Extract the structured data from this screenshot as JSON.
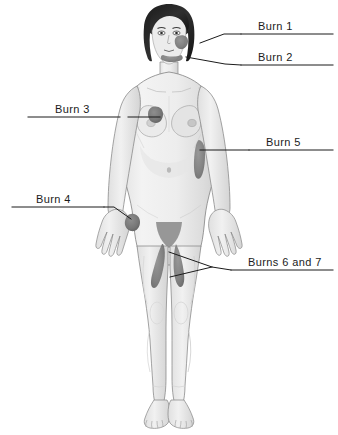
{
  "diagram": {
    "view": "anterior",
    "colors": {
      "skin": "#efefef",
      "skin_shadow": "#d6d6d6",
      "outline": "#6e6e6e",
      "hair": "#2a2a2a",
      "burn": "#7d7d7d",
      "burn_dark": "#5e5e5e",
      "leader_line": "#1b1b1b",
      "text": "#1b1b1b",
      "background": "#ffffff"
    },
    "labels": [
      {
        "id": "burn-1",
        "text": "Burn 1",
        "side": "right",
        "text_x": 258,
        "text_y": 20,
        "rule_x1": 241,
        "rule_x2": 333,
        "rule_y": 34,
        "leader": "M200,43 L224,34 L241,34",
        "site": "right cheek"
      },
      {
        "id": "burn-2",
        "text": "Burn 2",
        "side": "right",
        "text_x": 258,
        "text_y": 51,
        "rule_x1": 241,
        "rule_x2": 333,
        "rule_y": 65,
        "leader": "M186,57 L225,64 L241,65",
        "site": "jaw and chin"
      },
      {
        "id": "burn-3",
        "text": "Burn 3",
        "side": "left",
        "text_x": 55,
        "text_y": 103,
        "rule_x1": 28,
        "rule_x2": 120,
        "rule_y": 117,
        "leader": "M128,117 L160,117",
        "site": "upper left chest"
      },
      {
        "id": "burn-4",
        "text": "Burn 4",
        "side": "left",
        "text_x": 36,
        "text_y": 193,
        "rule_x1": 12,
        "rule_x2": 104,
        "rule_y": 207,
        "leader": "M104,207 L114,207 L131,219",
        "site": "back of left hand"
      },
      {
        "id": "burn-5",
        "text": "Burn 5",
        "side": "right",
        "text_x": 266,
        "text_y": 136,
        "rule_x1": 249,
        "rule_x2": 333,
        "rule_y": 150,
        "leader": "M200,150 L249,150",
        "site": "right flank of torso"
      },
      {
        "id": "burns-6-and-7",
        "text": "Burns 6 and 7",
        "side": "right",
        "text_x": 248,
        "text_y": 256,
        "rule_x1": 231,
        "rule_x2": 333,
        "rule_y": 270,
        "leader": "M169,252 L212,267 L231,270 M170,277 L212,267",
        "site": "inner thighs"
      }
    ],
    "burn_marks": [
      {
        "id": "mark-1",
        "site": "right cheek",
        "label_ref": "Burn 1"
      },
      {
        "id": "mark-2",
        "site": "jaw and chin",
        "label_ref": "Burn 2"
      },
      {
        "id": "mark-3",
        "site": "upper left chest",
        "label_ref": "Burn 3"
      },
      {
        "id": "mark-4",
        "site": "back of left hand",
        "label_ref": "Burn 4"
      },
      {
        "id": "mark-5",
        "site": "right flank",
        "label_ref": "Burn 5"
      },
      {
        "id": "mark-6",
        "site": "left inner thigh",
        "label_ref": "Burns 6 and 7"
      },
      {
        "id": "mark-7",
        "site": "right inner thigh",
        "label_ref": "Burns 6 and 7"
      }
    ]
  }
}
